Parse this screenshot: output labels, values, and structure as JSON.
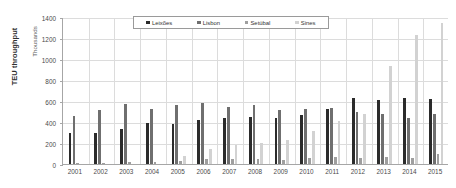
{
  "chart_data": {
    "type": "bar",
    "title": "",
    "xlabel": "",
    "ylabel": "TEU throughput",
    "ylabel_secondary": "Thousands",
    "ylim": [
      0,
      1400
    ],
    "ytick_step": 200,
    "yticks": [
      "0",
      "200",
      "400",
      "600",
      "800",
      "1000",
      "1200",
      "1400"
    ],
    "grid": true,
    "legend_position": "top-center",
    "categories": [
      "2001",
      "2002",
      "2003",
      "2004",
      "2005",
      "2006",
      "2007",
      "2008",
      "2009",
      "2010",
      "2011",
      "2012",
      "2013",
      "2014",
      "2015"
    ],
    "series": [
      {
        "name": "Leixões",
        "color": "#2b2b2b",
        "values": [
          295,
          300,
          330,
          390,
          380,
          420,
          440,
          450,
          435,
          465,
          520,
          630,
          605,
          625,
          615
        ]
      },
      {
        "name": "Lisbon",
        "color": "#6f6f6f",
        "values": [
          455,
          510,
          570,
          525,
          560,
          585,
          545,
          560,
          510,
          520,
          530,
          500,
          480,
          440,
          480
        ]
      },
      {
        "name": "Setúbal",
        "color": "#9f9f9f",
        "values": [
          10,
          12,
          15,
          20,
          30,
          50,
          45,
          50,
          40,
          55,
          65,
          60,
          70,
          60,
          95
        ]
      },
      {
        "name": "Sines",
        "color": "#d2d2d2",
        "values": [
          0,
          0,
          0,
          0,
          75,
          140,
          185,
          200,
          230,
          315,
          410,
          480,
          930,
          1230,
          1340
        ]
      }
    ]
  },
  "legend": {
    "items": [
      {
        "label": "Leixões",
        "color": "#2b2b2b"
      },
      {
        "label": "Lisbon",
        "color": "#6f6f6f"
      },
      {
        "label": "Setúbal",
        "color": "#9f9f9f"
      },
      {
        "label": "Sines",
        "color": "#d2d2d2"
      }
    ]
  }
}
